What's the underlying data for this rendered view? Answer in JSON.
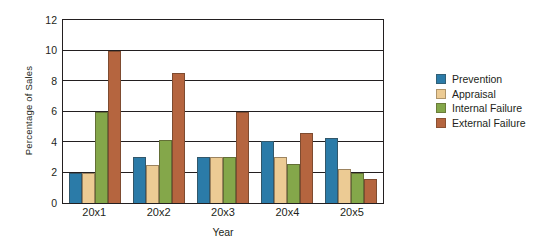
{
  "chart_data": {
    "type": "bar",
    "title": "",
    "xlabel": "Year",
    "ylabel": "Percentage of Sales",
    "categories": [
      "20x1",
      "20x2",
      "20x3",
      "20x4",
      "20x5"
    ],
    "ylim": [
      0,
      12
    ],
    "yticks": [
      0,
      2,
      4,
      6,
      8,
      10,
      12
    ],
    "grid": true,
    "legend_position": "right",
    "series": [
      {
        "name": "Prevention",
        "color": "#2a7ca8",
        "values": [
          2,
          3,
          3,
          4.05,
          4.25
        ]
      },
      {
        "name": "Appraisal",
        "color": "#eccb94",
        "values": [
          2,
          2.5,
          3,
          3,
          2.2
        ]
      },
      {
        "name": "Internal Failure",
        "color": "#84a council"
      }
    ]
  }
}
